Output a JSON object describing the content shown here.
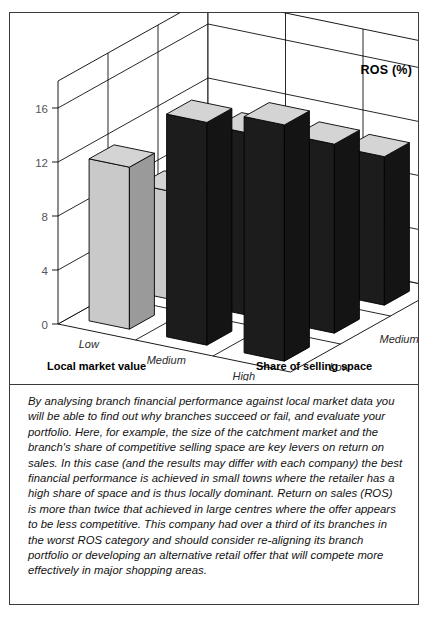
{
  "figure": {
    "ros_axis_title": "ROS (%)",
    "left_axis_name": "Local market value",
    "right_axis_name": "Share of selling space",
    "left_axis_categories": [
      "Low",
      "Medium",
      "High"
    ],
    "right_axis_categories": [
      "Low",
      "Medium",
      "High"
    ],
    "y_ticks_left": [
      "0",
      "4",
      "8",
      "12",
      "16"
    ],
    "y_ticks_right": [
      "0",
      "4",
      "8",
      "12",
      "16"
    ],
    "colors": {
      "bar_dark": "#1c1c1c",
      "bar_light": "#c9c9c9",
      "bar_top": "#d4d4d4",
      "bar_side_dark": "#141414",
      "bar_side_light": "#9a9a9a",
      "outline": "#000000",
      "frame": "#3a3a3a",
      "grid": "#000000",
      "tick_text": "#55545a"
    }
  },
  "chart_data": {
    "type": "bar",
    "title": "",
    "subtitle": "",
    "xlabel": "Local market value",
    "ylabel": "ROS (%)",
    "zlabel": "Share of selling space",
    "categories": [
      "Low",
      "Medium",
      "High"
    ],
    "series": [
      {
        "name": "Low",
        "values": [
          12.0,
          16.5,
          17.5
        ]
      },
      {
        "name": "Medium",
        "values": [
          8.0,
          13.5,
          14.0
        ]
      },
      {
        "name": "High",
        "values": [
          6.0,
          10.5,
          11.0
        ]
      }
    ],
    "series_axis": "Share of selling space",
    "ylim": [
      0,
      18
    ],
    "yticks": [
      0,
      4,
      8,
      12,
      16
    ],
    "grid": true,
    "legend": "none",
    "projection": "3d-isometric",
    "bar_fill_pattern": [
      "light",
      "dark",
      "dark",
      "light",
      "dark",
      "dark",
      "light",
      "dark",
      "dark"
    ]
  },
  "caption": {
    "paragraph": "By analysing branch financial performance against local market data you will be able to find out why branches succeed or fail, and evaluate your portfolio. Here, for example, the size of the catchment market and the branch's share of competitive selling space are key levers on return on sales. In this case (and the results may differ with each company) the best financial performance is achieved in small towns where the retailer has a high share of space and is thus locally dominant. Return on sales (ROS) is more than twice that achieved in large centres where the offer appears to be less competitive. This company had over a third of its branches in the worst ROS category and should consider re-aligning its branch portfolio or developing an alternative retail offer that will compete more effectively in major shopping areas."
  }
}
